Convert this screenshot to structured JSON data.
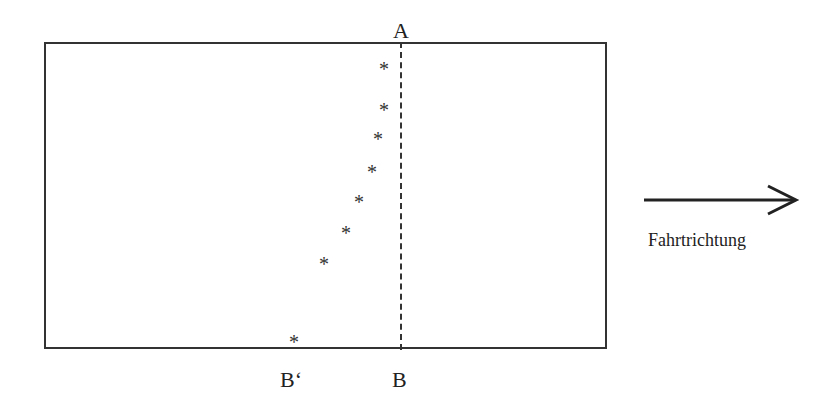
{
  "diagram": {
    "labels": {
      "top": "A",
      "bottom": "B",
      "bottom_shifted": "B‘"
    },
    "marker_symbol": "*",
    "markers": [
      {
        "x": 385,
        "y": 67
      },
      {
        "x": 385,
        "y": 108
      },
      {
        "x": 379,
        "y": 137
      },
      {
        "x": 373,
        "y": 170
      },
      {
        "x": 360,
        "y": 200
      },
      {
        "x": 347,
        "y": 231
      },
      {
        "x": 325,
        "y": 262
      },
      {
        "x": 295,
        "y": 340
      }
    ],
    "direction_caption": "Fahrtrichtung"
  }
}
